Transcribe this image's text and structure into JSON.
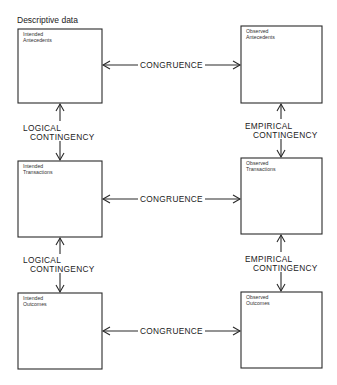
{
  "title": "Descriptive data",
  "boxes": [
    {
      "id": "intended-antecedents",
      "line1": "Intended",
      "line2": "Antecedents"
    },
    {
      "id": "observed-antecedents",
      "line1": "Observed",
      "line2": "Antecedents"
    },
    {
      "id": "intended-transactions",
      "line1": "Intended",
      "line2": "Transactions"
    },
    {
      "id": "observed-transactions",
      "line1": "Observed",
      "line2": "Transactions"
    },
    {
      "id": "intended-outcomes",
      "line1": "Intended",
      "line2": "Outcomes"
    },
    {
      "id": "observed-outcomes",
      "line1": "Observed",
      "line2": "Outcomes"
    }
  ],
  "horizontal_links": [
    {
      "label": "CONGRUENCE",
      "from": "intended-antecedents",
      "to": "observed-antecedents"
    },
    {
      "label": "CONGRUENCE",
      "from": "intended-transactions",
      "to": "observed-transactions"
    },
    {
      "label": "CONGRUENCE",
      "from": "intended-outcomes",
      "to": "observed-outcomes"
    }
  ],
  "vertical_links": [
    {
      "line1": "LOGICAL",
      "line2": "CONTINGENCY",
      "from": "intended-antecedents",
      "to": "intended-transactions"
    },
    {
      "line1": "EMPIRICAL",
      "line2": "CONTINGENCY",
      "from": "observed-antecedents",
      "to": "observed-transactions"
    },
    {
      "line1": "LOGICAL",
      "line2": "CONTINGENCY",
      "from": "intended-transactions",
      "to": "intended-outcomes"
    },
    {
      "line1": "EMPIRICAL",
      "line2": "CONTINGENCY",
      "from": "observed-transactions",
      "to": "observed-outcomes"
    }
  ],
  "colors": {
    "stroke": "#2a2a2a",
    "background": "#ffffff"
  }
}
